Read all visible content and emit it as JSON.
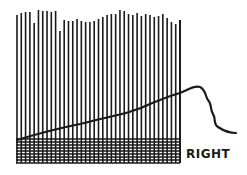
{
  "figure": {
    "label": "RIGHT",
    "ink_color": "#1a1a1a",
    "background": "#ffffff",
    "warp": {
      "x_start": 17,
      "x_end": 180,
      "count": 38,
      "bottom": 163,
      "tops": [
        15,
        13,
        12,
        12,
        23,
        10,
        11,
        11,
        12,
        11,
        31,
        20,
        21,
        21,
        19,
        21,
        22,
        22,
        21,
        19,
        17,
        15,
        14,
        14,
        10,
        11,
        14,
        15,
        13,
        16,
        14,
        15,
        17,
        16,
        14,
        18,
        22,
        24,
        20
      ]
    },
    "weave": {
      "top": 139,
      "bottom": 163,
      "row_spacing": 3
    },
    "weft_path": "M17,140 C40,133 60,128 80,124 C110,116 130,114 150,104 C165,98 172,95 180,93 C188,90 194,85 200,87 C206,90 205,96 208,100 C212,104 210,110 213,114 C216,118 213,124 218,127 C224,131 230,133 236,133"
  }
}
